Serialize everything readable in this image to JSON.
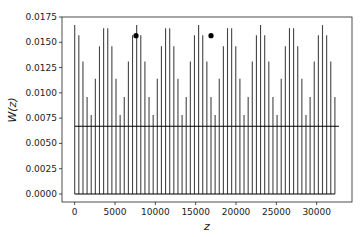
{
  "chart_data": {
    "type": "stem",
    "title": "",
    "xlabel": "z",
    "ylabel": "W(z)",
    "xlim": [
      -1600,
      34400
    ],
    "ylim": [
      -0.00075,
      0.0175
    ],
    "grid": false,
    "x_ticks": [
      0,
      5000,
      10000,
      15000,
      20000,
      25000,
      30000
    ],
    "x_tick_labels": [
      "0",
      "5000",
      "10000",
      "15000",
      "20000",
      "25000",
      "30000"
    ],
    "y_ticks": [
      0.0,
      0.0025,
      0.005,
      0.0075,
      0.01,
      0.0125,
      0.015,
      0.0175
    ],
    "y_tick_labels": [
      "0.0000",
      "0.0025",
      "0.0050",
      "0.0075",
      "0.0100",
      "0.0125",
      "0.0150",
      "0.0175"
    ],
    "stems": {
      "x_start": 0,
      "x_step": 512,
      "count": 64,
      "color": "#444444",
      "values": [
        0.0167,
        0.0157,
        0.0131,
        0.0096,
        0.0078,
        0.0114,
        0.0146,
        0.0164,
        0.0164,
        0.0146,
        0.0114,
        0.0078,
        0.0096,
        0.0131,
        0.0157,
        0.0167,
        0.0157,
        0.0131,
        0.0096,
        0.0078,
        0.0114,
        0.0146,
        0.0164,
        0.0164,
        0.0146,
        0.0114,
        0.0078,
        0.0096,
        0.0131,
        0.0157,
        0.0167,
        0.0157,
        0.0131,
        0.0096,
        0.0078,
        0.0114,
        0.0146,
        0.0164,
        0.0164,
        0.0146,
        0.0114,
        0.0078,
        0.0096,
        0.0131,
        0.0157,
        0.0167,
        0.0157,
        0.0131,
        0.0096,
        0.0078,
        0.0114,
        0.0146,
        0.0164,
        0.0164,
        0.0146,
        0.0114,
        0.0078,
        0.0096,
        0.0131,
        0.0157,
        0.0167,
        0.0157,
        0.0131,
        0.0096
      ]
    },
    "baseline": {
      "y": 0.0,
      "x_from": 0,
      "x_to": 32256,
      "color": "#000000"
    },
    "mean_line": {
      "y": 0.0067,
      "x_from": 0,
      "x_to": 32768,
      "color": "#000000"
    },
    "markers": [
      {
        "x": 7600,
        "y": 0.01565,
        "color": "#000000"
      },
      {
        "x": 16900,
        "y": 0.01565,
        "color": "#000000"
      }
    ]
  }
}
